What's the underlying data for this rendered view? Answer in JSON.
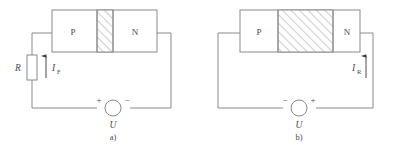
{
  "figure": {
    "type": "circuit-diagram-pair",
    "colors": {
      "line": "#8a8a8a",
      "text": "#4a4a4a",
      "hatch": "#9a9a9a",
      "background": "#ffffff"
    }
  },
  "diagram_a": {
    "caption": "a)",
    "junction": {
      "p_label": "P",
      "n_label": "N",
      "depletion_width": "narrow"
    },
    "resistor": {
      "label": "R"
    },
    "current": {
      "symbol": "I",
      "subscript": "F",
      "direction": "up"
    },
    "source": {
      "label": "U",
      "left_sign": "+",
      "right_sign": "−"
    }
  },
  "diagram_b": {
    "caption": "b)",
    "junction": {
      "p_label": "P",
      "n_label": "N",
      "depletion_width": "wide"
    },
    "current": {
      "symbol": "I",
      "subscript": "R",
      "direction": "up"
    },
    "source": {
      "label": "U",
      "left_sign": "−",
      "right_sign": "+"
    }
  }
}
